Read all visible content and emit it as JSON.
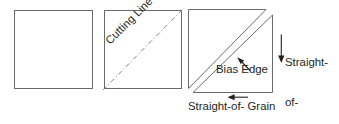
{
  "figure": {
    "background_color": "#ffffff",
    "line_color": "#58585b",
    "dark_line_color": "#231f20",
    "text_color": "#231f20",
    "panels": [
      {
        "id": "panel-plain-square",
        "name": "plain-square",
        "shape": "square",
        "labels": []
      },
      {
        "id": "panel-cutting-line",
        "name": "square-with-cutting-line",
        "shape": "square-with-diagonal",
        "line_style": "dash-dot",
        "labels": [
          "Cutting Line"
        ]
      },
      {
        "id": "panel-bias-triangles",
        "name": "separated-bias-triangles",
        "shape": "two-triangles",
        "labels": [
          "Bias Edge",
          "Straight-",
          "of-",
          "Grain",
          "Straight-of- Grain"
        ]
      }
    ]
  },
  "labels": {
    "cutting_line": "Cutting Line",
    "bias_edge": "Bias Edge",
    "straight_of_grain_vertical_line1": "Straight-",
    "straight_of_grain_vertical_line2": "of-",
    "straight_of_grain_vertical_line3": "Grain",
    "straight_of_grain_horizontal": "Straight-of- Grain"
  },
  "icons": {
    "down_arrow": "down-arrow-icon",
    "left_arrow": "left-arrow-icon",
    "leader_arrow": "leader-arrow-icon"
  }
}
